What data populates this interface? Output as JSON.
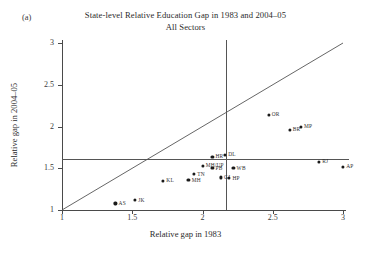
{
  "panel": {
    "label": "(a)"
  },
  "chart_data": {
    "type": "scatter",
    "title": "State-level Relative Education Gap in 1983 and 2004–05",
    "subtitle": "All Sectors",
    "xlabel": "Relative gap in 1983",
    "ylabel": "Relative gap in 2004–05",
    "xlim": [
      1,
      3
    ],
    "ylim": [
      1,
      3
    ],
    "xticks": [
      "1",
      "1.5",
      "2",
      "2.5",
      "3"
    ],
    "xtick_values": [
      1,
      1.5,
      2,
      2.5,
      3
    ],
    "yticks": [
      "1",
      "1.5",
      "2",
      "2.5",
      "3"
    ],
    "ytick_values": [
      1,
      1.5,
      2,
      2.5,
      3
    ],
    "grid": false,
    "legend": "none",
    "reference_lines": [
      {
        "name": "identity-line",
        "type": "diagonal",
        "from": [
          1,
          1
        ],
        "to": [
          3,
          3
        ]
      },
      {
        "name": "vertical-mean-line",
        "type": "vertical",
        "x": 2.17
      },
      {
        "name": "horizontal-mean-line",
        "type": "horizontal",
        "y": 1.61
      }
    ],
    "points": [
      {
        "label": "AS",
        "x": 1.38,
        "y": 1.08,
        "label_pos": "right"
      },
      {
        "label": "JK",
        "x": 1.52,
        "y": 1.12,
        "label_pos": "right"
      },
      {
        "label": "KL",
        "x": 1.72,
        "y": 1.35,
        "label_pos": "right"
      },
      {
        "label": "MH",
        "x": 1.9,
        "y": 1.36,
        "label_pos": "right"
      },
      {
        "label": "TN",
        "x": 1.94,
        "y": 1.43,
        "label_pos": "right"
      },
      {
        "label": "MH/UP",
        "x": 2.0,
        "y": 1.53,
        "label_pos": "right"
      },
      {
        "label": "PB",
        "x": 2.07,
        "y": 1.5,
        "label_pos": "right"
      },
      {
        "label": "GJ",
        "x": 2.13,
        "y": 1.39,
        "label_pos": "right"
      },
      {
        "label": "HP",
        "x": 2.19,
        "y": 1.38,
        "label_pos": "right"
      },
      {
        "label": "HR",
        "x": 2.07,
        "y": 1.64,
        "label_pos": "right"
      },
      {
        "label": "DL",
        "x": 2.16,
        "y": 1.66,
        "label_pos": "right"
      },
      {
        "label": "WB",
        "x": 2.22,
        "y": 1.5,
        "label_pos": "right"
      },
      {
        "label": "OR",
        "x": 2.47,
        "y": 2.14,
        "label_pos": "right"
      },
      {
        "label": "BR",
        "x": 2.62,
        "y": 1.96,
        "label_pos": "right"
      },
      {
        "label": "MP",
        "x": 2.7,
        "y": 2.0,
        "label_pos": "right"
      },
      {
        "label": "RJ",
        "x": 2.83,
        "y": 1.58,
        "label_pos": "right"
      },
      {
        "label": "AP",
        "x": 3.0,
        "y": 1.52,
        "label_pos": "right"
      }
    ]
  }
}
